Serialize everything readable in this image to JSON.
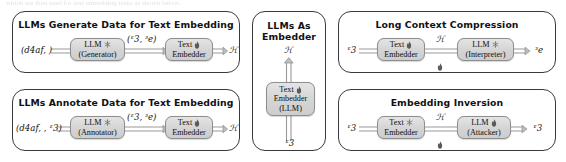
{
  "figure": {
    "bleed_text": "which are then used for text embedding tasks as shown below.",
    "background_color": "#ffffff",
    "panel_border_color": "#3a3a3a",
    "node_fill_color": "#d9d9d9",
    "icon_colors": {
      "flame": "#5a5a5a",
      "snowflake": "#6e6e6e"
    }
  },
  "panels": [
    {
      "id": "llms-generate-data",
      "title": "LLMs Generate Data for Text Embedding",
      "input_label": "(\u0001d4af, ℰ)",
      "nodes": [
        {
          "id": "llm-generator",
          "line1": "LLM",
          "line2": "(Generator)",
          "icon": "snowflake-icon"
        },
        {
          "id": "text-embedder",
          "line1": "Text",
          "line2": "Embedder",
          "icon": "flame-icon"
        }
      ],
      "mid_label": "(ᵋ3, ᵌe)",
      "output_label": "ℋ"
    },
    {
      "id": "llms-annotate-data",
      "title": "LLMs Annotate Data for Text Embedding",
      "input_label": "(\u0001d4af, ℰ, ᵋ3)",
      "nodes": [
        {
          "id": "llm-annotator",
          "line1": "LLM",
          "line2": "(Annotator)",
          "icon": "snowflake-icon"
        },
        {
          "id": "text-embedder",
          "line1": "Text",
          "line2": "Embedder",
          "icon": "flame-icon"
        }
      ],
      "mid_label": "(ᵋ3, ᵌe)",
      "output_label": "ℋ"
    },
    {
      "id": "llms-as-embedder",
      "title_line1": "LLMs As",
      "title_line2": "Embedder",
      "input_label": "ᵋ3",
      "nodes": [
        {
          "id": "text-embedder-llm",
          "line1": "Text",
          "line2": "Embedder",
          "line3": "(LLM)",
          "icon": "flame-icon"
        }
      ],
      "output_label": "ℋ"
    },
    {
      "id": "long-context-compression",
      "title": "Long Context Compression",
      "input_label": "ᵋ3",
      "nodes": [
        {
          "id": "text-embedder",
          "line1": "Text",
          "line2": "Embedder",
          "icon": "flame-icon"
        },
        {
          "id": "llm-interpreter",
          "line1": "LLM",
          "line2": "(Interpreter)",
          "icon": "snowflake-icon"
        }
      ],
      "mid_label": "ℋ",
      "mid_icon": "flame-icon",
      "output_label": "ᵌe"
    },
    {
      "id": "embedding-inversion",
      "title": "Embedding Inversion",
      "input_label": "ᵋ3",
      "nodes": [
        {
          "id": "text-embedder",
          "line1": "Text",
          "line2": "Embedder",
          "icon": "snowflake-icon"
        },
        {
          "id": "llm-attacker",
          "line1": "LLM",
          "line2": "(Attacker)",
          "icon": "flame-icon"
        }
      ],
      "mid_label": "ℋ",
      "mid_icon": "flame-icon",
      "output_label": "ᵋ3"
    }
  ]
}
